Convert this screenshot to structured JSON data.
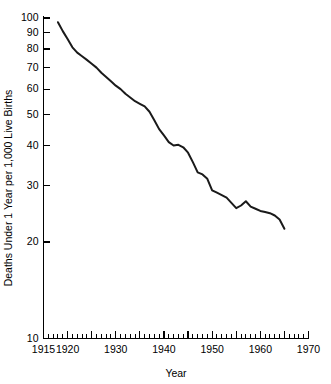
{
  "chart_data": {
    "type": "line",
    "title": "",
    "xlabel": "Year",
    "ylabel": "Deaths Under 1 Year per 1,000 Live Births",
    "xlim": [
      1915,
      1970
    ],
    "ylim": [
      10,
      100
    ],
    "yscale": "log",
    "xscale": "linear",
    "grid": false,
    "legend": null,
    "y_tick_labels": [
      "100",
      "90",
      "80",
      "70",
      "60",
      "50",
      "40",
      "30",
      "20",
      "10"
    ],
    "y_ticks": [
      100,
      90,
      80,
      70,
      60,
      50,
      40,
      30,
      20,
      10
    ],
    "x_tick_labels": [
      "1915",
      "1920",
      "1930",
      "1940",
      "1950",
      "1960",
      "1970"
    ],
    "x_ticks_major": [
      1915,
      1920,
      1925,
      1930,
      1935,
      1940,
      1945,
      1950,
      1955,
      1960,
      1965,
      1970
    ],
    "x_ticks_minor_step": 1,
    "series": [
      {
        "name": "Infant mortality rate",
        "color": "#1a1a1a",
        "x": [
          1918,
          1919,
          1920,
          1921,
          1922,
          1923,
          1924,
          1925,
          1926,
          1927,
          1928,
          1929,
          1930,
          1931,
          1932,
          1933,
          1934,
          1935,
          1936,
          1937,
          1938,
          1939,
          1940,
          1941,
          1942,
          1943,
          1944,
          1945,
          1946,
          1947,
          1948,
          1949,
          1950,
          1951,
          1952,
          1953,
          1954,
          1955,
          1956,
          1957,
          1958,
          1959,
          1960,
          1961,
          1962,
          1963,
          1964,
          1965
        ],
        "values": [
          97.0,
          91.0,
          86.0,
          81.0,
          78.0,
          76.0,
          74.0,
          72.0,
          70.0,
          67.5,
          65.5,
          63.5,
          61.5,
          60.0,
          58.0,
          56.5,
          55.0,
          54.0,
          53.0,
          51.0,
          48.0,
          45.0,
          43.0,
          41.0,
          40.0,
          40.2,
          39.5,
          38.0,
          35.5,
          33.0,
          32.5,
          31.5,
          29.0,
          28.5,
          28.0,
          27.5,
          26.5,
          25.5,
          26.0,
          26.8,
          25.8,
          25.4,
          25.0,
          24.8,
          24.6,
          24.2,
          23.5,
          22.0
        ]
      }
    ]
  },
  "axes": {
    "x_axis_label": "Year",
    "y_axis_label": "Deaths Under 1 Year per 1,000 Live Births"
  }
}
